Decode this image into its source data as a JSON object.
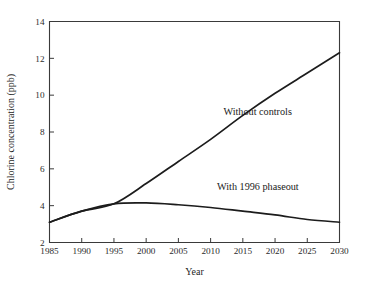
{
  "chart_data": {
    "type": "line",
    "title": "",
    "xlabel": "Year",
    "ylabel": "Chlorine concentration (ppb)",
    "xlim": [
      1985,
      2030
    ],
    "ylim": [
      2,
      14
    ],
    "xticks": [
      1985,
      1990,
      1995,
      2000,
      2005,
      2010,
      2015,
      2020,
      2025,
      2030
    ],
    "yticks": [
      2,
      4,
      6,
      8,
      10,
      12,
      14
    ],
    "grid": false,
    "legend_position": "inline-annotations",
    "series": [
      {
        "name": "Without controls",
        "x": [
          1985,
          1990,
          1995,
          2000,
          2005,
          2010,
          2015,
          2020,
          2025,
          2030
        ],
        "values": [
          3.1,
          3.7,
          4.1,
          5.2,
          6.4,
          7.6,
          8.9,
          10.1,
          11.2,
          12.3
        ]
      },
      {
        "name": "With 1996 phaseout",
        "x": [
          1985,
          1990,
          1995,
          2000,
          2005,
          2010,
          2015,
          2020,
          2025,
          2030
        ],
        "values": [
          3.1,
          3.7,
          4.1,
          4.15,
          4.05,
          3.9,
          3.7,
          3.5,
          3.25,
          3.1
        ]
      }
    ],
    "annotations": [
      {
        "text": "Without controls",
        "x": 2012,
        "y": 8.9
      },
      {
        "text": "With 1996 phaseout",
        "x": 2011,
        "y": 4.85
      }
    ],
    "colors": {
      "line": "#1c1c1c",
      "axis": "#3a3a3a",
      "background": "#ffffff",
      "text": "#1f1f1f"
    }
  }
}
